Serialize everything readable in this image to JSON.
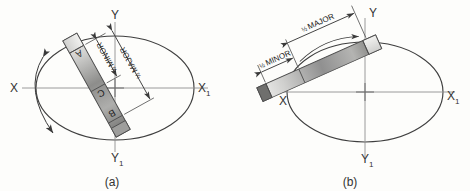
{
  "figure": {
    "type": "engineering-drawing",
    "background_color": "#fdfdfb",
    "ink_color": "#3a3a3a",
    "strip_light": "#e8e8e6",
    "strip_dark": "#7b7b79"
  },
  "panels": [
    {
      "id": "a",
      "caption": "(a)",
      "axes": {
        "x_left_label": "X",
        "x_right_label": "X",
        "x_right_sub": "1",
        "y_top_label": "Y",
        "y_bottom_label": "Y",
        "y_bottom_sub": "1"
      },
      "strip": {
        "orientation": "steep",
        "points": [
          {
            "label": "A",
            "role": "end-of-half-major"
          },
          {
            "label": "C",
            "role": "end-of-half-minor"
          },
          {
            "label": "B",
            "role": "tracing-point"
          }
        ]
      },
      "dimensions": [
        {
          "numerator": "1",
          "denominator": "2",
          "name": "MINOR"
        },
        {
          "numerator": "1",
          "denominator": "2",
          "name": "MAJOR"
        }
      ]
    },
    {
      "id": "b",
      "caption": "(b)",
      "axes": {
        "x_left_label": "X",
        "x_right_label": "X",
        "x_right_sub": "1",
        "y_top_label": "Y",
        "y_bottom_label": "Y",
        "y_bottom_sub": "1"
      },
      "strip": {
        "orientation": "shallow",
        "points": []
      },
      "dimensions": [
        {
          "numerator": "1",
          "denominator": "2",
          "name": "MINOR"
        },
        {
          "numerator": "1",
          "denominator": "2",
          "name": "MAJOR"
        }
      ]
    }
  ]
}
